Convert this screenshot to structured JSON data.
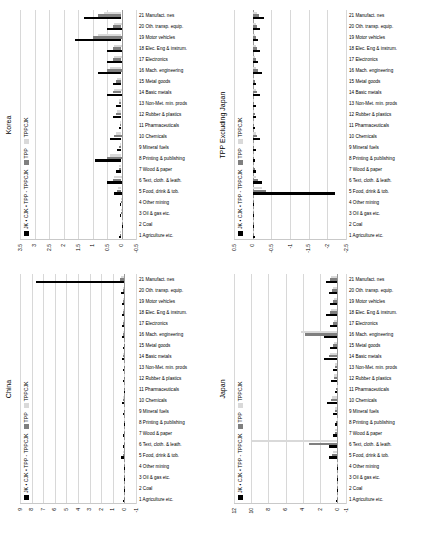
{
  "figure": {
    "panels": [
      {
        "id": "china",
        "title": "China",
        "legend": [
          "JK • CJK • TPP - TPPCJK",
          "TPP",
          "TPPCJK"
        ],
        "legend_colors": [
          "#000000",
          "#7f7f7f",
          "#d9d9d9"
        ],
        "ylim": [
          -1,
          9
        ],
        "yticks": [
          -1,
          0,
          1,
          2,
          3,
          4,
          5,
          6,
          7,
          8,
          9
        ]
      },
      {
        "id": "japan",
        "title": "Japan",
        "legend": [
          "JK • CJK • TPP - TPPCJK",
          "TPP",
          "TPPCJK"
        ],
        "legend_colors": [
          "#000000",
          "#7f7f7f",
          "#d9d9d9"
        ],
        "ylim": [
          -1,
          12
        ],
        "yticks": [
          -1,
          0,
          2,
          4,
          6,
          8,
          10,
          12
        ]
      },
      {
        "id": "korea",
        "title": "Korea",
        "legend": [
          "JK • CJK • TPP - TPPCJK",
          "TPP",
          "TPPCJK"
        ],
        "legend_colors": [
          "#000000",
          "#7f7f7f",
          "#d9d9d9"
        ],
        "ylim": [
          -0.5,
          3.5
        ],
        "yticks": [
          -0.5,
          0,
          0.5,
          1,
          1.5,
          2,
          2.5,
          3,
          3.5
        ]
      },
      {
        "id": "tpp_excluding_japan",
        "title": "TPP Excluding Japan",
        "legend": [
          "JK • CJK • TPP - TPPCJK",
          "TPP",
          "TPPCJK"
        ],
        "legend_colors": [
          "#000000",
          "#7f7f7f",
          "#d9d9d9"
        ],
        "ylim": [
          -2.5,
          0.5
        ],
        "yticks": [
          0.5,
          0,
          -0.5,
          -1,
          -1.5,
          -2,
          -2.5
        ]
      }
    ],
    "categories": [
      "1 Agriculture etc.",
      "2 Coal",
      "3 Oil & gas etc.",
      "4 Other mining",
      "5 Food, drink & tob.",
      "6 Text, cloth. & leath.",
      "7 Wood & paper",
      "8 Printing & publishing",
      "9 Mineral fuels",
      "10 Chemicals",
      "11 Pharmaceuticals",
      "12 Rubber & plastics",
      "13 Non-Met. min. prods",
      "14 Basic metals",
      "15 Metal goods",
      "16 Mach. engineering",
      "17 Electronics",
      "18 Elec. Eng & instrum.",
      "19 Motor vehicles",
      "20 Oth. transp. equip.",
      "21 Manufact. nes"
    ]
  },
  "chart_data": [
    {
      "type": "bar",
      "title": "China",
      "xlabel": "",
      "ylabel": "",
      "ylim": [
        -1,
        9
      ],
      "grid": true,
      "legend_position": "top-left",
      "categories": [
        "1 Agriculture etc.",
        "2 Coal",
        "3 Oil & gas etc.",
        "4 Other mining",
        "5 Food, drink & tob.",
        "6 Text, cloth. & leath.",
        "7 Wood & paper",
        "8 Printing & publishing",
        "9 Mineral fuels",
        "10 Chemicals",
        "11 Pharmaceuticals",
        "12 Rubber & plastics",
        "13 Non-Met. min. prods",
        "14 Basic metals",
        "15 Metal goods",
        "16 Mach. engineering",
        "17 Electronics",
        "18 Elec. Eng & instrum.",
        "19 Motor vehicles",
        "20 Oth. transp. equip.",
        "21 Manufact. nes"
      ],
      "series": [
        {
          "name": "JK • CJK • TPP - TPPCJK",
          "values": [
            0.1,
            0.0,
            0.05,
            0.05,
            0.3,
            0.1,
            0.1,
            0.05,
            0.1,
            0.2,
            0.05,
            0.1,
            0.1,
            0.2,
            0.1,
            0.2,
            0.2,
            0.2,
            0.2,
            0.3,
            7.6
          ]
        },
        {
          "name": "TPP",
          "values": [
            0.05,
            0.0,
            0.02,
            0.02,
            0.15,
            0.05,
            0.05,
            0.02,
            0.05,
            0.1,
            0.02,
            0.05,
            0.05,
            0.1,
            0.05,
            0.1,
            0.1,
            0.1,
            0.1,
            0.15,
            0.4
          ]
        },
        {
          "name": "TPPCJK",
          "values": [
            0.05,
            0.0,
            0.02,
            0.02,
            0.1,
            0.05,
            0.05,
            0.02,
            0.05,
            0.1,
            0.02,
            0.05,
            0.05,
            0.1,
            0.05,
            0.1,
            0.1,
            0.1,
            0.1,
            0.1,
            0.3
          ]
        }
      ]
    },
    {
      "type": "bar",
      "title": "Japan",
      "xlabel": "",
      "ylabel": "",
      "ylim": [
        -1,
        12
      ],
      "grid": true,
      "legend_position": "top-left",
      "categories": [
        "1 Agriculture etc.",
        "2 Coal",
        "3 Oil & gas etc.",
        "4 Other mining",
        "5 Food, drink & tob.",
        "6 Text, cloth. & leath.",
        "7 Wood & paper",
        "8 Printing & publishing",
        "9 Mineral fuels",
        "10 Chemicals",
        "11 Pharmaceuticals",
        "12 Rubber & plastics",
        "13 Non-Met. min. prods",
        "14 Basic metals",
        "15 Metal goods",
        "16 Mach. engineering",
        "17 Electronics",
        "18 Elec. Eng & instrum.",
        "19 Motor vehicles",
        "20 Oth. transp. equip.",
        "21 Manufact. nes"
      ],
      "series": [
        {
          "name": "JK • CJK • TPP - TPPCJK",
          "values": [
            0.2,
            0.0,
            0.1,
            0.1,
            1.0,
            1.0,
            0.5,
            0.3,
            0.5,
            1.2,
            0.3,
            0.7,
            0.5,
            1.6,
            0.8,
            1.5,
            0.9,
            1.3,
            0.9,
            1.0,
            1.3
          ]
        },
        {
          "name": "TPP",
          "values": [
            0.1,
            0.0,
            0.05,
            0.05,
            0.6,
            3.3,
            0.3,
            0.15,
            0.3,
            0.7,
            0.15,
            0.4,
            0.3,
            1.0,
            0.5,
            3.8,
            0.5,
            0.8,
            0.5,
            0.6,
            0.8
          ]
        },
        {
          "name": "TPPCJK",
          "values": [
            0.1,
            0.0,
            0.05,
            0.05,
            0.5,
            9.9,
            0.25,
            0.1,
            0.25,
            0.6,
            0.1,
            0.35,
            0.25,
            0.9,
            0.4,
            4.2,
            0.4,
            0.7,
            0.4,
            0.5,
            0.7
          ]
        }
      ]
    },
    {
      "type": "bar",
      "title": "Korea",
      "xlabel": "",
      "ylabel": "",
      "ylim": [
        -0.5,
        3.5
      ],
      "grid": true,
      "legend_position": "top-left",
      "categories": [
        "1 Agriculture etc.",
        "2 Coal",
        "3 Oil & gas etc.",
        "4 Other mining",
        "5 Food, drink & tob.",
        "6 Text, cloth. & leath.",
        "7 Wood & paper",
        "8 Printing & publishing",
        "9 Mineral fuels",
        "10 Chemicals",
        "11 Pharmaceuticals",
        "12 Rubber & plastics",
        "13 Non-Met. min. prods",
        "14 Basic metals",
        "15 Metal goods",
        "16 Mach. engineering",
        "17 Electronics",
        "18 Elec. Eng & instrum.",
        "19 Motor vehicles",
        "20 Oth. transp. equip.",
        "21 Manufact. nes"
      ],
      "series": [
        {
          "name": "JK • CJK • TPP - TPPCJK",
          "values": [
            0.1,
            0.0,
            0.05,
            0.05,
            0.25,
            0.5,
            0.2,
            0.9,
            0.15,
            0.4,
            0.1,
            0.3,
            0.2,
            0.5,
            0.3,
            0.8,
            0.5,
            0.5,
            1.6,
            0.5,
            1.3
          ]
        },
        {
          "name": "TPP",
          "values": [
            0.05,
            0.0,
            0.02,
            0.02,
            0.15,
            0.3,
            0.1,
            0.5,
            0.08,
            0.25,
            0.05,
            0.18,
            0.1,
            0.3,
            0.18,
            0.5,
            0.3,
            0.3,
            1.0,
            0.3,
            0.8
          ]
        },
        {
          "name": "TPPCJK",
          "values": [
            0.05,
            0.0,
            0.02,
            0.02,
            0.12,
            0.25,
            0.08,
            0.4,
            0.06,
            0.2,
            0.04,
            0.15,
            0.08,
            0.25,
            0.15,
            0.4,
            0.25,
            0.25,
            0.8,
            0.25,
            0.6
          ]
        }
      ]
    },
    {
      "type": "bar",
      "title": "TPP Excluding Japan",
      "xlabel": "",
      "ylabel": "",
      "ylim": [
        -2.5,
        0.5
      ],
      "grid": true,
      "legend_position": "top-left",
      "categories": [
        "1 Agriculture etc.",
        "2 Coal",
        "3 Oil & gas etc.",
        "4 Other mining",
        "5 Food, drink & tob.",
        "6 Text, cloth. & leath.",
        "7 Wood & paper",
        "8 Printing & publishing",
        "9 Mineral fuels",
        "10 Chemicals",
        "11 Pharmaceuticals",
        "12 Rubber & plastics",
        "13 Non-Met. min. prods",
        "14 Basic metals",
        "15 Metal goods",
        "16 Mach. engineering",
        "17 Electronics",
        "18 Elec. Eng & instrum.",
        "19 Motor vehicles",
        "20 Oth. transp. equip.",
        "21 Manufact. nes"
      ],
      "series": [
        {
          "name": "JK • CJK • TPP - TPPCJK",
          "values": [
            -0.05,
            0.0,
            -0.02,
            -0.02,
            -2.2,
            -0.25,
            -0.1,
            -0.05,
            -0.08,
            -0.2,
            -0.05,
            -0.1,
            -0.08,
            -0.2,
            -0.1,
            -0.25,
            -0.15,
            -0.2,
            -0.15,
            -0.2,
            -0.3
          ]
        },
        {
          "name": "TPP",
          "values": [
            -0.03,
            0.0,
            -0.01,
            -0.01,
            -0.35,
            -0.15,
            -0.05,
            -0.03,
            -0.04,
            -0.12,
            -0.03,
            -0.06,
            -0.04,
            -0.12,
            -0.06,
            -0.15,
            -0.08,
            -0.12,
            -0.08,
            -0.12,
            -0.18
          ]
        },
        {
          "name": "TPPCJK",
          "values": [
            -0.02,
            0.0,
            -0.01,
            -0.01,
            -0.25,
            -0.1,
            -0.04,
            -0.02,
            -0.03,
            -0.08,
            -0.02,
            -0.04,
            -0.03,
            -0.08,
            -0.04,
            -0.1,
            -0.05,
            -0.08,
            -0.05,
            -0.08,
            -0.12
          ]
        }
      ]
    }
  ]
}
